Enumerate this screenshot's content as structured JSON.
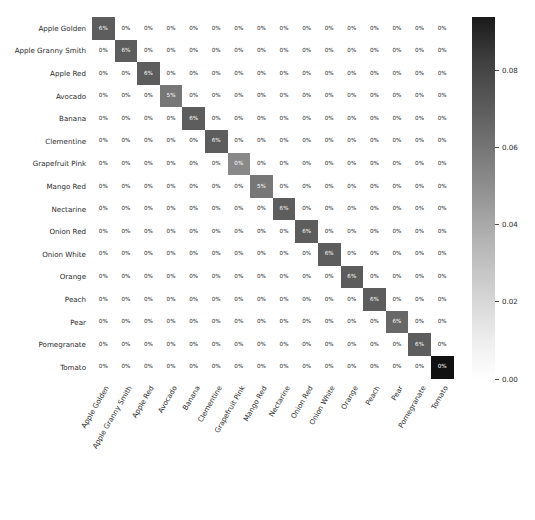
{
  "chart_data": {
    "type": "heatmap",
    "title": "",
    "xlabel": "",
    "ylabel": "",
    "grid": false,
    "colormap": "Greys",
    "categories": [
      "Apple Golden",
      "Apple Granny Smith",
      "Apple Red",
      "Avocado",
      "Banana",
      "Clementine",
      "Grapefruit Pink",
      "Mango Red",
      "Nectarine",
      "Onion Red",
      "Onion White",
      "Orange",
      "Peach",
      "Pear",
      "Pomegranate",
      "Tomato"
    ],
    "x_categories": [
      "Apple Golden",
      "Apple Granny Smith",
      "Apple Red",
      "Avocado",
      "Banana",
      "Clementine",
      "Grapefruit Pink",
      "Mango Red",
      "Nectarine",
      "Onion Red",
      "Onion White",
      "Orange",
      "Peach",
      "Pear",
      "Pomegranate",
      "Tomato"
    ],
    "diagonal_values": [
      0.062,
      0.062,
      0.062,
      0.052,
      0.062,
      0.062,
      0.045,
      0.052,
      0.062,
      0.062,
      0.062,
      0.062,
      0.062,
      0.058,
      0.062,
      0.09
    ],
    "values": [
      [
        0.062,
        0,
        0,
        0,
        0,
        0,
        0,
        0,
        0,
        0,
        0,
        0,
        0,
        0,
        0,
        0
      ],
      [
        0,
        0.062,
        0,
        0,
        0,
        0,
        0,
        0,
        0,
        0,
        0,
        0,
        0,
        0,
        0,
        0
      ],
      [
        0,
        0,
        0.062,
        0,
        0,
        0,
        0,
        0,
        0,
        0,
        0,
        0,
        0,
        0,
        0,
        0
      ],
      [
        0,
        0,
        0,
        0.052,
        0,
        0,
        0,
        0,
        0,
        0,
        0,
        0,
        0,
        0,
        0,
        0
      ],
      [
        0,
        0,
        0,
        0,
        0.062,
        0,
        0,
        0,
        0,
        0,
        0,
        0,
        0,
        0,
        0,
        0
      ],
      [
        0,
        0,
        0,
        0,
        0,
        0.062,
        0,
        0,
        0,
        0,
        0,
        0,
        0,
        0,
        0,
        0
      ],
      [
        0,
        0,
        0,
        0,
        0,
        0,
        0.045,
        0,
        0,
        0,
        0,
        0,
        0,
        0,
        0,
        0
      ],
      [
        0,
        0,
        0,
        0,
        0,
        0,
        0,
        0.052,
        0,
        0,
        0,
        0,
        0,
        0,
        0,
        0
      ],
      [
        0,
        0,
        0,
        0,
        0,
        0,
        0,
        0,
        0.062,
        0,
        0,
        0,
        0,
        0,
        0,
        0
      ],
      [
        0,
        0,
        0,
        0,
        0,
        0,
        0,
        0,
        0,
        0.062,
        0,
        0,
        0,
        0,
        0,
        0
      ],
      [
        0,
        0,
        0,
        0,
        0,
        0,
        0,
        0,
        0,
        0,
        0.062,
        0,
        0,
        0,
        0,
        0
      ],
      [
        0,
        0,
        0,
        0,
        0,
        0,
        0,
        0,
        0,
        0,
        0,
        0.062,
        0,
        0,
        0,
        0
      ],
      [
        0,
        0,
        0,
        0,
        0,
        0,
        0,
        0,
        0,
        0,
        0,
        0,
        0.062,
        0,
        0,
        0
      ],
      [
        0,
        0,
        0,
        0,
        0,
        0,
        0,
        0,
        0,
        0,
        0,
        0,
        0,
        0.058,
        0,
        0
      ],
      [
        0,
        0,
        0,
        0,
        0,
        0,
        0,
        0,
        0,
        0,
        0,
        0,
        0,
        0,
        0.062,
        0
      ],
      [
        0,
        0,
        0,
        0,
        0,
        0,
        0,
        0,
        0,
        0,
        0,
        0,
        0,
        0,
        0,
        0.09
      ]
    ],
    "cell_labels": [
      [
        "6%",
        "0%",
        "0%",
        "0%",
        "0%",
        "0%",
        "0%",
        "0%",
        "0%",
        "0%",
        "0%",
        "0%",
        "0%",
        "0%",
        "0%",
        "0%"
      ],
      [
        "0%",
        "6%",
        "0%",
        "0%",
        "0%",
        "0%",
        "0%",
        "0%",
        "0%",
        "0%",
        "0%",
        "0%",
        "0%",
        "0%",
        "0%",
        "0%"
      ],
      [
        "0%",
        "0%",
        "6%",
        "0%",
        "0%",
        "0%",
        "0%",
        "0%",
        "0%",
        "0%",
        "0%",
        "0%",
        "0%",
        "0%",
        "0%",
        "0%"
      ],
      [
        "0%",
        "0%",
        "0%",
        "5%",
        "0%",
        "0%",
        "0%",
        "0%",
        "0%",
        "0%",
        "0%",
        "0%",
        "0%",
        "0%",
        "0%",
        "0%"
      ],
      [
        "0%",
        "0%",
        "0%",
        "0%",
        "6%",
        "0%",
        "0%",
        "0%",
        "0%",
        "0%",
        "0%",
        "0%",
        "0%",
        "0%",
        "0%",
        "0%"
      ],
      [
        "0%",
        "0%",
        "0%",
        "0%",
        "0%",
        "6%",
        "0%",
        "0%",
        "0%",
        "0%",
        "0%",
        "0%",
        "0%",
        "0%",
        "0%",
        "0%"
      ],
      [
        "0%",
        "0%",
        "0%",
        "0%",
        "0%",
        "0%",
        "0%",
        "0%",
        "0%",
        "0%",
        "0%",
        "0%",
        "0%",
        "0%",
        "0%",
        "0%"
      ],
      [
        "0%",
        "0%",
        "0%",
        "0%",
        "0%",
        "0%",
        "0%",
        "5%",
        "0%",
        "0%",
        "0%",
        "0%",
        "0%",
        "0%",
        "0%",
        "0%"
      ],
      [
        "0%",
        "0%",
        "0%",
        "0%",
        "0%",
        "0%",
        "0%",
        "0%",
        "6%",
        "0%",
        "0%",
        "0%",
        "0%",
        "0%",
        "0%",
        "0%"
      ],
      [
        "0%",
        "0%",
        "0%",
        "0%",
        "0%",
        "0%",
        "0%",
        "0%",
        "0%",
        "6%",
        "0%",
        "0%",
        "0%",
        "0%",
        "0%",
        "0%"
      ],
      [
        "0%",
        "0%",
        "0%",
        "0%",
        "0%",
        "0%",
        "0%",
        "0%",
        "0%",
        "0%",
        "6%",
        "0%",
        "0%",
        "0%",
        "0%",
        "0%"
      ],
      [
        "0%",
        "0%",
        "0%",
        "0%",
        "0%",
        "0%",
        "0%",
        "0%",
        "0%",
        "0%",
        "0%",
        "6%",
        "0%",
        "0%",
        "0%",
        "0%"
      ],
      [
        "0%",
        "0%",
        "0%",
        "0%",
        "0%",
        "0%",
        "0%",
        "0%",
        "0%",
        "0%",
        "0%",
        "0%",
        "6%",
        "0%",
        "0%",
        "0%"
      ],
      [
        "0%",
        "0%",
        "0%",
        "0%",
        "0%",
        "0%",
        "0%",
        "0%",
        "0%",
        "0%",
        "0%",
        "0%",
        "0%",
        "6%",
        "0%",
        "0%"
      ],
      [
        "0%",
        "0%",
        "0%",
        "0%",
        "0%",
        "0%",
        "0%",
        "0%",
        "0%",
        "0%",
        "0%",
        "0%",
        "0%",
        "0%",
        "6%",
        "0%"
      ],
      [
        "0%",
        "0%",
        "0%",
        "0%",
        "0%",
        "0%",
        "0%",
        "0%",
        "0%",
        "0%",
        "0%",
        "0%",
        "0%",
        "0%",
        "0%",
        "0%"
      ]
    ],
    "colorbar": {
      "orientation": "vertical",
      "ticks": [
        "0.08",
        "0.06",
        "0.04",
        "0.02",
        "0.00"
      ],
      "tick_values": [
        0.08,
        0.06,
        0.04,
        0.02,
        0.0
      ],
      "vmin": 0.0,
      "vmax": 0.0938
    }
  },
  "colors": {
    "text": "#2b2b2b",
    "cell_text_light": "#ffffff",
    "cell_text_dark": "#262626",
    "background": "#ffffff"
  }
}
